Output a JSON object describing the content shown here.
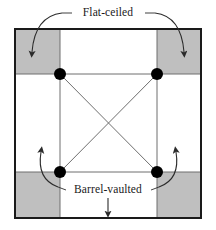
{
  "figure": {
    "type": "architectural-plan-diagram"
  },
  "labels": {
    "top": "Flat-ceiled",
    "bottom": "Barrel-vaulted"
  },
  "colors": {
    "shaded_bay_fill": "#bfbfbf",
    "shaded_bay_stroke": "#8a8a8a",
    "outer_frame_stroke": "#1a1a1a",
    "inner_grid_stroke": "#6e6e6e",
    "diagonal_stroke": "#6e6e6e",
    "pier_dot_fill": "#000000",
    "arrow_stroke": "#2b2b2b",
    "background": "#ffffff"
  },
  "geometry": {
    "outer_frame": {
      "x": 15,
      "y": 29,
      "width": 186,
      "height": 189
    },
    "grid_lines_vertical_x": [
      60,
      157
    ],
    "grid_lines_horizontal_y": [
      74,
      172
    ],
    "corner_bays": [
      {
        "name": "top-left",
        "x": 15,
        "y": 29,
        "width": 45,
        "height": 45,
        "shaded": true
      },
      {
        "name": "top-right",
        "x": 157,
        "y": 29,
        "width": 44,
        "height": 45,
        "shaded": true
      },
      {
        "name": "bottom-left",
        "x": 15,
        "y": 172,
        "width": 45,
        "height": 46,
        "shaded": true
      },
      {
        "name": "bottom-right",
        "x": 157,
        "y": 172,
        "width": 44,
        "height": 46,
        "shaded": true
      }
    ],
    "pier_dots": [
      {
        "name": "pier-top-left",
        "cx": 60,
        "cy": 74,
        "r": 6
      },
      {
        "name": "pier-top-right",
        "cx": 157,
        "cy": 74,
        "r": 6
      },
      {
        "name": "pier-bottom-left",
        "cx": 60,
        "cy": 172,
        "r": 6
      },
      {
        "name": "pier-bottom-right",
        "cx": 157,
        "cy": 172,
        "r": 6
      }
    ],
    "diagonals": [
      {
        "x1": 60,
        "y1": 74,
        "x2": 157,
        "y2": 172
      },
      {
        "x1": 157,
        "y1": 74,
        "x2": 60,
        "y2": 172
      }
    ]
  },
  "annotations": {
    "top_label_position": {
      "x": 108,
      "y": 13
    },
    "bottom_label_position": {
      "x": 108,
      "y": 190
    },
    "arrows": [
      {
        "name": "arrow-top-left",
        "target": "top-left-bay",
        "direction": "down-left"
      },
      {
        "name": "arrow-top-right",
        "target": "top-right-bay",
        "direction": "down-right"
      },
      {
        "name": "arrow-bottom-left",
        "target": "bottom-left-bay-above",
        "direction": "up-left"
      },
      {
        "name": "arrow-bottom-right",
        "target": "bottom-right-bay-above",
        "direction": "up-right"
      },
      {
        "name": "arrow-bottom-center",
        "target": "bottom-center-bay",
        "direction": "down"
      }
    ]
  }
}
